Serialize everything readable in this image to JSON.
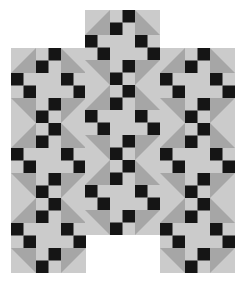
{
  "pattern": {
    "title": "",
    "colors": {
      "background": "#ffffff",
      "light": "#cbcbcb",
      "triangle": "#a6a6a6",
      "square": "#151515"
    },
    "cell_size": 12.5,
    "block": {
      "cols": 6,
      "rows": 6,
      "black_cells": [
        [
          0,
          3
        ],
        [
          1,
          2
        ],
        [
          2,
          0
        ],
        [
          2,
          4
        ],
        [
          3,
          1
        ],
        [
          3,
          5
        ],
        [
          4,
          3
        ],
        [
          5,
          2
        ]
      ]
    },
    "columns": [
      {
        "name": "left-strip",
        "x": 11,
        "y": 48,
        "blocks": 3
      },
      {
        "name": "middle-strip",
        "x": 85,
        "y": 10,
        "blocks": 3
      },
      {
        "name": "right-strip",
        "x": 160,
        "y": 48,
        "blocks": 3
      }
    ]
  }
}
